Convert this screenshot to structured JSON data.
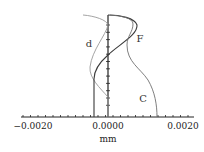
{
  "chart_data": {
    "type": "line",
    "title": "",
    "xlabel": "mm",
    "ylabel": "",
    "xlim": [
      -0.0026,
      0.0026
    ],
    "ylim": [
      0,
      1
    ],
    "grid": false,
    "x_tick_labels": [
      "-0.0020",
      "0.0000",
      "0.0020"
    ],
    "x_ticks": [
      -0.002,
      0.0,
      0.002
    ],
    "series": [
      {
        "name": "d",
        "color": "#9a9a9a",
        "points": [
          [
            -0.001,
            1.0
          ],
          [
            0.0,
            0.9
          ],
          [
            -0.0003,
            0.75
          ],
          [
            -0.0005,
            0.5
          ],
          [
            -0.0002,
            0.3
          ],
          [
            0.0,
            0.2
          ],
          [
            0.0,
            0.0
          ]
        ]
      },
      {
        "name": "F",
        "color": "#444444",
        "points": [
          [
            0.0,
            1.0
          ],
          [
            0.0006,
            0.97
          ],
          [
            0.0008,
            0.9
          ],
          [
            0.0005,
            0.78
          ],
          [
            0.0,
            0.6
          ],
          [
            -0.0003,
            0.4
          ],
          [
            -0.00037,
            0.3
          ],
          [
            -0.00037,
            0.0
          ]
        ]
      },
      {
        "name": "C",
        "color": "#777777",
        "points": [
          [
            0.0001,
            1.0
          ],
          [
            0.0006,
            0.95
          ],
          [
            0.0007,
            0.88
          ],
          [
            0.00055,
            0.75
          ],
          [
            0.0006,
            0.6
          ],
          [
            0.0011,
            0.4
          ],
          [
            0.0014,
            0.15
          ],
          [
            0.0014,
            0.0
          ]
        ]
      }
    ]
  },
  "labels": {
    "tick_neg": "−0.0020",
    "tick_zero": "0.0000",
    "tick_pos": "0.0020",
    "xlabel": "mm",
    "curve_d": "d",
    "curve_F": "F",
    "curve_C": "C"
  }
}
